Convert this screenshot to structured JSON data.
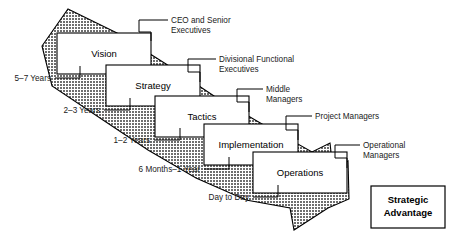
{
  "diagram": {
    "arrow": {
      "name": "strategy-cascade-arrow",
      "fill_color": "#7a7a7a",
      "stroke_color": "#000000",
      "direction": "top-left to bottom-right"
    },
    "stages": [
      {
        "id": "vision",
        "label": "Vision",
        "time_horizon": "5–7 Years",
        "role": "CEO and Senior Executives"
      },
      {
        "id": "strategy",
        "label": "Strategy",
        "time_horizon": "2–3 Years",
        "role": "Divisional Functional Executives"
      },
      {
        "id": "tactics",
        "label": "Tactics",
        "time_horizon": "1–2 Years",
        "role": "Middle Managers"
      },
      {
        "id": "implementation",
        "label": "Implementation",
        "time_horizon": "6 Months–1 Year",
        "role": "Project Managers"
      },
      {
        "id": "operations",
        "label": "Operations",
        "time_horizon": "Day to Day",
        "role": "Operational Managers"
      }
    ],
    "role_labels": [
      {
        "id": "ceo-senior-executives",
        "line1": "CEO and Senior",
        "line2": "Executives"
      },
      {
        "id": "divisional-functional-executives",
        "line1": "Divisional Functional",
        "line2": "Executives"
      },
      {
        "id": "middle-managers",
        "line1": "Middle",
        "line2": "Managers"
      },
      {
        "id": "project-managers",
        "line1": "Project Managers",
        "line2": ""
      },
      {
        "id": "operational-managers",
        "line1": "Operational",
        "line2": "Managers"
      }
    ],
    "time_labels": [
      {
        "id": "time-vision",
        "text": "5–7 Years"
      },
      {
        "id": "time-strategy",
        "text": "2–3 Years"
      },
      {
        "id": "time-tactics",
        "text": "1–2 Years"
      },
      {
        "id": "time-implementation",
        "text": "6 Months–1 Year"
      },
      {
        "id": "time-operations",
        "text": "Day to Day"
      }
    ],
    "outcome": {
      "id": "strategic-advantage",
      "line1": "Strategic",
      "line2": "Advantage"
    }
  }
}
